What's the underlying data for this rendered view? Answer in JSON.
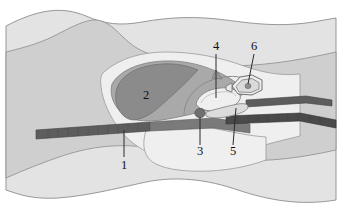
{
  "figure": {
    "kind": "medical-illustration",
    "background": "#ffffff",
    "canvas": {
      "width": 338,
      "height": 224
    }
  },
  "palette": {
    "outer_tissue": "#e3e3e3",
    "mid_tissue": "#cfcfcf",
    "inner_tissue": "#dcdcdc",
    "pale_cavity": "#efefef",
    "light_gray_mass": "#a9a9a9",
    "dark_gray_mass": "#8b8b8b",
    "dark_band": "#5d5d5d",
    "darker_band": "#4a4a4a",
    "dot_fill": "#707070",
    "outline": "#6e6e6e",
    "leader_line": "#2a2a2a",
    "label_text": "#101010"
  },
  "labels": [
    {
      "id": "label-1",
      "text": "1",
      "x": 124,
      "y": 166,
      "leader": {
        "x1": 124,
        "y1": 157,
        "x2": 124,
        "y2": 130
      }
    },
    {
      "id": "label-2",
      "text": "2",
      "x": 146,
      "y": 96,
      "leader": null
    },
    {
      "id": "label-3",
      "text": "3",
      "x": 200,
      "y": 152,
      "leader": {
        "x1": 200,
        "y1": 145,
        "x2": 200,
        "y2": 117
      }
    },
    {
      "id": "label-4",
      "text": "4",
      "x": 216,
      "y": 47,
      "leader": {
        "x1": 216,
        "y1": 54,
        "x2": 216,
        "y2": 98
      }
    },
    {
      "id": "label-5",
      "text": "5",
      "x": 233,
      "y": 152,
      "leader": {
        "x1": 233,
        "y1": 145,
        "x2": 236,
        "y2": 108
      }
    },
    {
      "id": "label-6",
      "text": "6",
      "x": 254,
      "y": 47,
      "leader": {
        "x1": 254,
        "y1": 54,
        "x2": 248,
        "y2": 84
      }
    }
  ],
  "structures": [
    {
      "name": "outer-body-outline",
      "label_ref": null,
      "shade": "outer_tissue"
    },
    {
      "name": "mid-tissue-layer",
      "label_ref": null,
      "shade": "mid_tissue"
    },
    {
      "name": "pale-cavity-region",
      "label_ref": null,
      "shade": "pale_cavity"
    },
    {
      "name": "light-gray-mass",
      "label_ref": "2",
      "shade": "light_gray_mass"
    },
    {
      "name": "dark-gray-mass",
      "label_ref": "2",
      "shade": "dark_gray_mass"
    },
    {
      "name": "horizontal-dark-band",
      "label_ref": "1",
      "shade": "dark_band"
    },
    {
      "name": "upper-right-band",
      "label_ref": null,
      "shade": "dark_band"
    },
    {
      "name": "lower-right-band",
      "label_ref": null,
      "shade": "darker_band"
    },
    {
      "name": "elongated-oval",
      "label_ref": "4",
      "shade": "pale_cavity"
    },
    {
      "name": "small-dark-dot",
      "label_ref": "3",
      "shade": "dot_fill"
    },
    {
      "name": "curved-process",
      "label_ref": "5",
      "shade": "inner_tissue"
    },
    {
      "name": "polygonal-structure",
      "label_ref": "6",
      "shade": "pale_cavity"
    }
  ]
}
